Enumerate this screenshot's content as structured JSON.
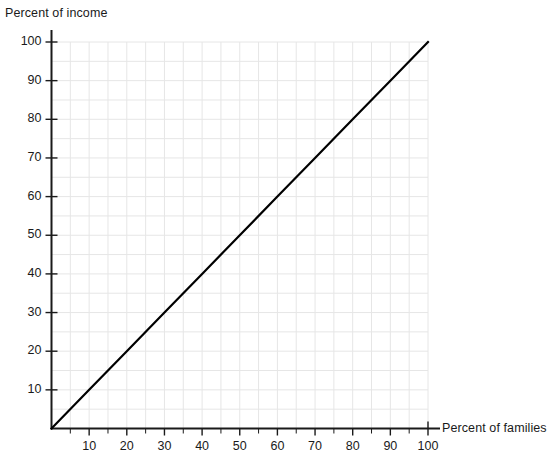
{
  "chart_data": {
    "type": "line",
    "title": "",
    "xlabel": "Percent of families",
    "ylabel": "Percent of income",
    "xlim": [
      0,
      100
    ],
    "ylim": [
      0,
      100
    ],
    "grid": true,
    "grid_minor_step": 5,
    "legend": "none",
    "xticks": [
      10,
      20,
      30,
      40,
      50,
      60,
      70,
      80,
      90,
      100
    ],
    "yticks": [
      10,
      20,
      30,
      40,
      50,
      60,
      70,
      80,
      90,
      100
    ],
    "xtick_labels": [
      "10",
      "20",
      "30",
      "40",
      "50",
      "60",
      "70",
      "80",
      "90",
      "100"
    ],
    "ytick_labels": [
      "10",
      "20",
      "30",
      "40",
      "50",
      "60",
      "70",
      "80",
      "90",
      "100"
    ],
    "series": [
      {
        "name": "line of perfect equality",
        "x": [
          0,
          10,
          20,
          30,
          40,
          50,
          60,
          70,
          80,
          90,
          100
        ],
        "values": [
          0,
          10,
          20,
          30,
          40,
          50,
          60,
          70,
          80,
          90,
          100
        ]
      }
    ],
    "colors": {
      "line": "#000000",
      "axis": "#1a1a1a",
      "grid": "#e6e6e6",
      "background": "#ffffff",
      "text": "#1a1a1a"
    }
  },
  "axes": {
    "y_title": "Percent of income",
    "x_title": "Percent of families"
  },
  "yticks": [
    {
      "value": 100,
      "label": "100"
    },
    {
      "value": 90,
      "label": "90"
    },
    {
      "value": 80,
      "label": "80"
    },
    {
      "value": 70,
      "label": "70"
    },
    {
      "value": 60,
      "label": "60"
    },
    {
      "value": 50,
      "label": "50"
    },
    {
      "value": 40,
      "label": "40"
    },
    {
      "value": 30,
      "label": "30"
    },
    {
      "value": 20,
      "label": "20"
    },
    {
      "value": 10,
      "label": "10"
    }
  ],
  "xticks": [
    {
      "value": 10,
      "label": "10"
    },
    {
      "value": 20,
      "label": "20"
    },
    {
      "value": 30,
      "label": "30"
    },
    {
      "value": 40,
      "label": "40"
    },
    {
      "value": 50,
      "label": "50"
    },
    {
      "value": 60,
      "label": "60"
    },
    {
      "value": 70,
      "label": "70"
    },
    {
      "value": 80,
      "label": "80"
    },
    {
      "value": 90,
      "label": "90"
    },
    {
      "value": 100,
      "label": "100"
    }
  ]
}
